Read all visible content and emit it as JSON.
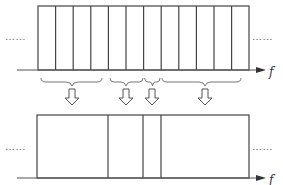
{
  "diagram": {
    "axis_label": "f",
    "ellipsis": "……",
    "top": {
      "slots": 12,
      "x_start": 38,
      "x_end": 249,
      "y_top": 6,
      "y_axis": 70
    },
    "groups": [
      {
        "slots": 4,
        "arrow_x": 72
      },
      {
        "slots": 2,
        "arrow_x": 126
      },
      {
        "slots": 1,
        "arrow_x": 152
      },
      {
        "slots": 5,
        "arrow_x": 205
      }
    ],
    "bottom": {
      "y_top": 115,
      "y_axis": 178,
      "dividers": [
        108,
        143,
        161
      ]
    },
    "colors": {
      "line": "#444444",
      "background": "#ffffff"
    }
  }
}
